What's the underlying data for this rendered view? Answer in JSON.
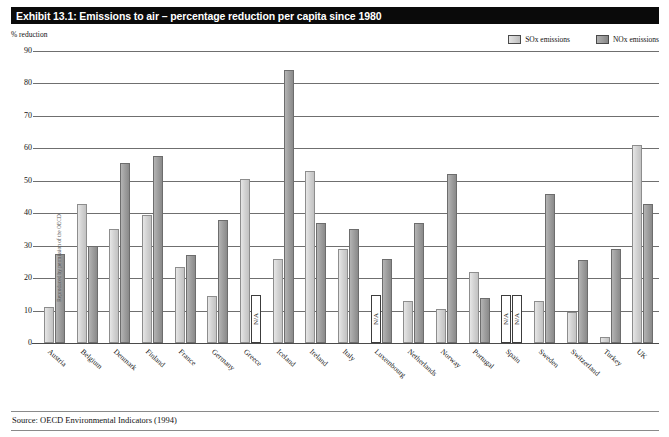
{
  "exhibit": {
    "title": "Exhibit 13.1: Emissions to air – percentage reduction per capita since 1980",
    "axis_note": "% reduction",
    "source": "Source: OECD Environmental Indicators (1994)",
    "side_credit": "Reproduced by permission of the OECD",
    "na_label": "N/A"
  },
  "legend": {
    "items": [
      {
        "label": "SOx emissions",
        "icon": "square-swatch-icon",
        "color": "#d2d2d2"
      },
      {
        "label": "NOx emissions",
        "icon": "square-swatch-icon",
        "color": "#9e9e9e"
      }
    ]
  },
  "chart_data": {
    "type": "bar",
    "title": "Exhibit 13.1: Emissions to air – percentage reduction per capita since 1980",
    "xlabel": "",
    "ylabel": "% reduction",
    "ylim": [
      0,
      90
    ],
    "yticks": [
      90,
      80,
      70,
      60,
      50,
      40,
      30,
      20,
      10,
      0
    ],
    "grid": true,
    "legend_position": "top-right",
    "categories": [
      "Austria",
      "Belgium",
      "Denmark",
      "Finland",
      "France",
      "Germany",
      "Greece",
      "Iceland",
      "Ireland",
      "Italy",
      "Luxembourg",
      "Netherlands",
      "Norway",
      "Portugal",
      "Spain",
      "Sweden",
      "Switzerland",
      "Turkey",
      "UK"
    ],
    "series": [
      {
        "name": "SOx emissions",
        "color": "#d2d2d2",
        "values": [
          11,
          43,
          35,
          39.5,
          23.5,
          14.5,
          50.5,
          26,
          53,
          29,
          null,
          13,
          10.5,
          22,
          null,
          13,
          9.5,
          2,
          61
        ]
      },
      {
        "name": "NOx emissions",
        "color": "#9e9e9e",
        "values": [
          27.5,
          30,
          55.5,
          57.5,
          27,
          38,
          null,
          84,
          37,
          35,
          26,
          37,
          52,
          14,
          null,
          46,
          25.5,
          29,
          43
        ]
      }
    ],
    "na_markers": [
      {
        "category": "Greece",
        "series": "NOx emissions",
        "label": "N/A"
      },
      {
        "category": "Luxembourg",
        "series": "SOx emissions",
        "label": "N/A"
      },
      {
        "category": "Spain",
        "series": "SOx emissions",
        "label": "N/A"
      },
      {
        "category": "Spain",
        "series": "NOx emissions",
        "label": "N/A"
      }
    ]
  }
}
